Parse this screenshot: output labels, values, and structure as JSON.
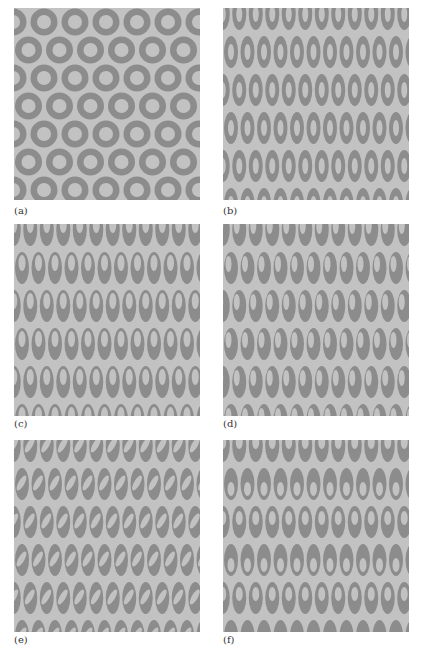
{
  "figure": {
    "colors": {
      "background": "#c2c2c2",
      "shape": "#8c8c8c"
    },
    "panels": [
      {
        "id": "a",
        "label": "(a)",
        "description": "hexagonal lattice of circular rings with centered circular holes",
        "lattice": {
          "dx": 31,
          "dy": 28,
          "row_offset": 15.5,
          "x0": 14.5,
          "y0": 14
        },
        "outer": {
          "rx": 13.5,
          "ry": 13.5
        },
        "hole": {
          "rx": 7,
          "ry": 7,
          "cx_off": 0,
          "cy_off": 0,
          "rot": 0,
          "alt_cy_off": 0
        }
      },
      {
        "id": "b",
        "label": "(b)",
        "description": "staggered lattice of vertical elliptical rings with centered elliptical holes",
        "lattice": {
          "dx": 16.5,
          "dy": 38,
          "row_offset": 8.25,
          "x0": 8,
          "y0": 6
        },
        "outer": {
          "rx": 7,
          "ry": 16
        },
        "hole": {
          "rx": 3,
          "ry": 8,
          "cx_off": 0,
          "cy_off": 0,
          "rot": 0,
          "alt_cy_off": 0
        }
      },
      {
        "id": "c",
        "label": "(c)",
        "description": "vertical elliptical rings with holes displaced toward the top",
        "lattice": {
          "dx": 16.5,
          "dy": 38,
          "row_offset": 8.25,
          "x0": 8,
          "y0": 6
        },
        "outer": {
          "rx": 7,
          "ry": 16
        },
        "hole": {
          "rx": 3.5,
          "ry": 8,
          "cx_off": 0,
          "cy_off": -5,
          "rot": 0,
          "alt_cy_off": -5
        }
      },
      {
        "id": "d",
        "label": "(d)",
        "description": "vertical elliptical rings with holes displaced toward the upper-left",
        "lattice": {
          "dx": 16.5,
          "dy": 38,
          "row_offset": 8.25,
          "x0": 8,
          "y0": 6
        },
        "outer": {
          "rx": 7,
          "ry": 16
        },
        "hole": {
          "rx": 3,
          "ry": 8,
          "cx_off": -2.5,
          "cy_off": -4,
          "rot": 0,
          "alt_cy_off": -4
        }
      },
      {
        "id": "e",
        "label": "(e)",
        "description": "vertical elliptical rings with tilted elliptical holes",
        "lattice": {
          "dx": 16.5,
          "dy": 38,
          "row_offset": 8.25,
          "x0": 8,
          "y0": 6
        },
        "outer": {
          "rx": 7,
          "ry": 16
        },
        "hole": {
          "rx": 3,
          "ry": 8.5,
          "cx_off": -0.5,
          "cy_off": -1,
          "rot": -30,
          "alt_cy_off": -1
        }
      },
      {
        "id": "f",
        "label": "(f)",
        "description": "vertical elliptical rings with hole displacement alternating down/up by row",
        "lattice": {
          "dx": 16.5,
          "dy": 38,
          "row_offset": 8.25,
          "x0": 8,
          "y0": 6
        },
        "outer": {
          "rx": 7,
          "ry": 16
        },
        "hole": {
          "rx": 3.5,
          "ry": 7,
          "cx_off": 0,
          "cy_off": 5,
          "rot": 0,
          "alt_cy_off": -4
        }
      }
    ]
  }
}
